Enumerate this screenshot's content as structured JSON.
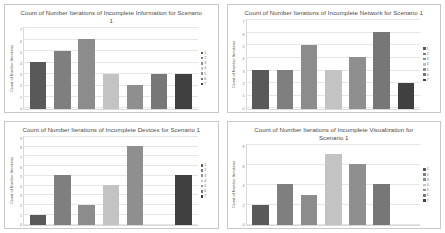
{
  "page": {
    "background": "#ffffff",
    "panel_border_color": "#c8c8c8"
  },
  "series_colors": [
    "#595959",
    "#7f7f7f",
    "#8c8c8c",
    "#c3c3c3",
    "#8f8f8f",
    "#777777",
    "#404040"
  ],
  "legend_labels": [
    "1",
    "2",
    "3",
    "4",
    "5",
    "6",
    "7"
  ],
  "charts": [
    {
      "id": "incomplete-information",
      "title": "Count of Number Iterations of Incomplete Information for Scenario 1",
      "ylabel": "Count of Number Iterations",
      "chart_data": {
        "type": "bar",
        "title": "Count of Number Iterations of Incomplete Information for Scenario 1",
        "xlabel": "",
        "ylabel": "Count of Number Iterations",
        "categories": [
          "1",
          "2",
          "3",
          "4",
          "5",
          "6",
          "7"
        ],
        "values": [
          4,
          5,
          6,
          3,
          2,
          3,
          3
        ],
        "ylim": [
          0,
          7
        ],
        "yticks": [
          "0",
          "1",
          "2",
          "3",
          "4",
          "5",
          "6",
          "7"
        ],
        "grid": true,
        "legend_position": "right"
      }
    },
    {
      "id": "incomplete-network",
      "title": "Count of Number Iterations of Incomplete Network for Scenario 1",
      "ylabel": "Count of Number Iterations",
      "chart_data": {
        "type": "bar",
        "title": "Count of Number Iterations of Incomplete Network for Scenario 1",
        "xlabel": "",
        "ylabel": "Count of Number Iterations",
        "categories": [
          "1",
          "2",
          "3",
          "4",
          "5",
          "6",
          "7"
        ],
        "values": [
          3,
          3,
          5,
          3,
          4,
          6,
          2
        ],
        "ylim": [
          0,
          7
        ],
        "yticks": [
          "0",
          "1",
          "2",
          "3",
          "4",
          "5",
          "6",
          "7"
        ],
        "grid": true,
        "legend_position": "right"
      }
    },
    {
      "id": "incomplete-devices",
      "title": "Count of Number Iterations of Incomplete Devices for Scenario 1",
      "ylabel": "Count of Number Iterations",
      "chart_data": {
        "type": "bar",
        "title": "Count of Number Iterations of Incomplete Devices for Scenario 1",
        "xlabel": "",
        "ylabel": "Count of Number Iterations",
        "categories": [
          "1",
          "2",
          "3",
          "4",
          "5",
          "6",
          "7"
        ],
        "values": [
          1,
          5,
          2,
          4,
          8,
          0,
          5
        ],
        "ylim": [
          0,
          9
        ],
        "yticks": [
          "0",
          "1",
          "2",
          "3",
          "4",
          "5",
          "6",
          "7",
          "8",
          "9"
        ],
        "grid": true,
        "legend_position": "right"
      }
    },
    {
      "id": "incomplete-visualization",
      "title": "Count of Number Iterations of Incomplete Visualization for Scenario 1",
      "ylabel": "Count of Number Iterations",
      "chart_data": {
        "type": "bar",
        "title": "Count of Number Iterations of Incomplete Visualization for Scenario 1",
        "xlabel": "",
        "ylabel": "Count of Number Iterations",
        "categories": [
          "1",
          "2",
          "3",
          "4",
          "5",
          "6",
          "7"
        ],
        "values": [
          2,
          4,
          3,
          7,
          6,
          4,
          0
        ],
        "ylim": [
          0,
          8
        ],
        "yticks": [
          "0",
          "2",
          "4",
          "6",
          "8"
        ],
        "grid": true,
        "legend_position": "right"
      }
    }
  ]
}
